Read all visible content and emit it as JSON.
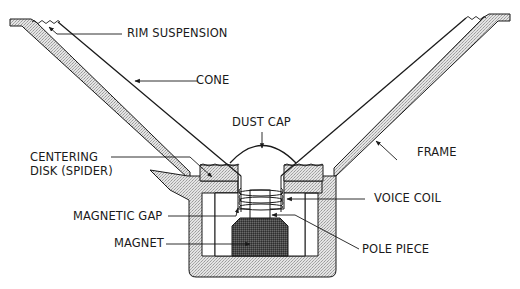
{
  "diagram": {
    "colors": {
      "line": "#1a1a1a",
      "frame_fill": "#dcdcdc",
      "magnet_fill": "#555555",
      "background": "#ffffff"
    },
    "labels": {
      "rim_suspension": "RIM SUSPENSION",
      "cone": "CONE",
      "dust_cap": "DUST CAP",
      "frame": "FRAME",
      "centering_disk_line1": "CENTERING",
      "centering_disk_line2": "DISK (SPIDER)",
      "voice_coil": "VOICE COIL",
      "magnetic_gap": "MAGNETIC GAP",
      "magnet": "MAGNET",
      "pole_piece": "POLE PIECE"
    }
  }
}
